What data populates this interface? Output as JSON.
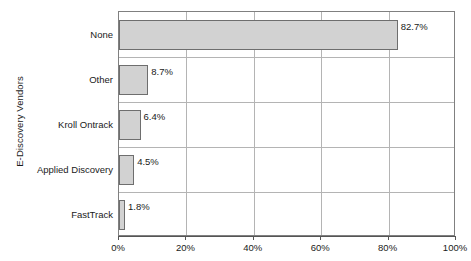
{
  "chart_data": {
    "type": "bar",
    "orientation": "horizontal",
    "title": "",
    "xlabel": "",
    "ylabel": "E-Discovery Vendors",
    "categories": [
      "None",
      "Other",
      "Kroll Ontrack",
      "Applied Discovery",
      "FastTrack"
    ],
    "values": [
      82.7,
      8.7,
      6.4,
      4.5,
      1.8
    ],
    "value_labels": [
      "82.7%",
      "8.7%",
      "6.4%",
      "4.5%",
      "1.8%"
    ],
    "xlim": [
      0,
      100
    ],
    "xticks": [
      0,
      20,
      40,
      60,
      80,
      100
    ],
    "xtick_labels": [
      "0%",
      "20%",
      "40%",
      "60%",
      "80%",
      "100%"
    ],
    "grid": true,
    "legend": false,
    "bar_fill_color": "#d2d2d2",
    "bar_border_color": "#6e6e6e",
    "grid_color": "#b4b4b4",
    "axis_color": "#808080",
    "background_color": "#ffffff"
  }
}
